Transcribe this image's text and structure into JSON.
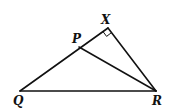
{
  "diagram": {
    "type": "geometry",
    "colors": {
      "stroke": "#111111",
      "background": "#ffffff"
    },
    "points": {
      "Q": {
        "label": "Q",
        "x": 20,
        "y": 91
      },
      "R": {
        "label": "R",
        "x": 156,
        "y": 91
      },
      "X": {
        "label": "X",
        "x": 108,
        "y": 28
      },
      "P": {
        "label": "P",
        "x": 79,
        "y": 47
      }
    },
    "segments": [
      "QX",
      "XR",
      "QR",
      "PR"
    ],
    "right_angle_at": "X"
  }
}
